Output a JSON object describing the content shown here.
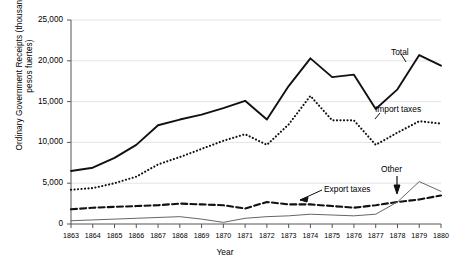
{
  "chart_data": {
    "type": "line",
    "title": "",
    "xlabel": "Year",
    "ylabel": "Ordinary Government Receipts (thousands of pesos fuertes)",
    "categories": [
      1863,
      1864,
      1865,
      1866,
      1867,
      1868,
      1869,
      1870,
      1871,
      1872,
      1873,
      1874,
      1875,
      1876,
      1877,
      1878,
      1879,
      1880
    ],
    "xlim": [
      1863,
      1880
    ],
    "ylim": [
      0,
      25000
    ],
    "yticks": [
      0,
      5000,
      10000,
      15000,
      20000,
      25000
    ],
    "ytick_labels": [
      "0",
      "5,000",
      "10,000",
      "15,000",
      "20,000",
      "25,000"
    ],
    "xtick_labels": [
      "1863",
      "1864",
      "1865",
      "1866",
      "1867",
      "1868",
      "1869",
      "1870",
      "1871",
      "1872",
      "1873",
      "1874",
      "1875",
      "1876",
      "1877",
      "1878",
      "1879",
      "1880"
    ],
    "grid": "horizontal",
    "legend": "inline-annotations",
    "series": [
      {
        "name": "Total",
        "style": "solid-thick",
        "color": "#111111",
        "values": [
          6500,
          6900,
          8100,
          9700,
          12100,
          12800,
          13400,
          14200,
          15100,
          12800,
          16900,
          20300,
          18000,
          18300,
          14100,
          16500,
          20700,
          19400
        ]
      },
      {
        "name": "Import taxes",
        "style": "dotted",
        "color": "#111111",
        "values": [
          4200,
          4400,
          5000,
          5800,
          7300,
          8200,
          9200,
          10200,
          11000,
          9700,
          12200,
          15700,
          12700,
          12700,
          9700,
          11200,
          12600,
          12300
        ]
      },
      {
        "name": "Export taxes",
        "style": "dashed",
        "color": "#111111",
        "values": [
          1800,
          2000,
          2100,
          2200,
          2300,
          2500,
          2400,
          2300,
          1900,
          2700,
          2400,
          2400,
          2200,
          2000,
          2300,
          2700,
          3000,
          3500
        ]
      },
      {
        "name": "Other",
        "style": "solid-thin",
        "color": "#666666",
        "values": [
          400,
          500,
          600,
          700,
          800,
          900,
          600,
          200,
          700,
          900,
          1000,
          1200,
          1100,
          1000,
          1200,
          2700,
          5200,
          4000
        ]
      }
    ],
    "annotations": [
      {
        "label": "Total",
        "x": 391,
        "y": 47
      },
      {
        "label": "Import taxes",
        "x": 375,
        "y": 104
      },
      {
        "label": "Export taxes",
        "x": 324,
        "y": 184
      },
      {
        "label": "Other",
        "x": 381,
        "y": 164
      }
    ]
  }
}
